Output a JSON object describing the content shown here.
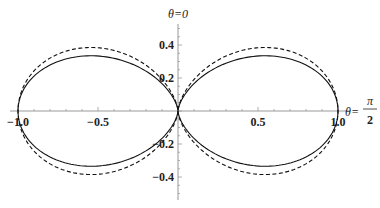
{
  "chart_data": {
    "type": "line",
    "title": "",
    "xlabel": "θ=π/2",
    "ylabel": "θ=0",
    "xlim": [
      -1.0,
      1.0
    ],
    "ylim": [
      -0.5,
      0.5
    ],
    "x_ticks": [
      {
        "value": -1.0,
        "label": "−1.0"
      },
      {
        "value": -0.5,
        "label": "−0.5"
      },
      {
        "value": 0.5,
        "label": "0.5"
      },
      {
        "value": 1.0,
        "label": "1.0"
      }
    ],
    "y_ticks": [
      {
        "value": 0.4,
        "label": "0.4"
      },
      {
        "value": 0.2,
        "label": "0.2"
      },
      {
        "value": -0.2,
        "label": "−0.2"
      },
      {
        "value": -0.4,
        "label": "−0.4"
      }
    ],
    "grid": false,
    "legend": null,
    "series": [
      {
        "name": "solid",
        "style": "solid",
        "color": "#111111",
        "peak_y": 0.333,
        "peak_x": 0.54,
        "x_extent": 1.0,
        "y_scale": 0.87
      },
      {
        "name": "dashed",
        "style": "dashed",
        "color": "#111111",
        "peak_y": 0.376,
        "peak_x": 0.54,
        "x_extent": 1.0,
        "y_scale": 1.0
      }
    ]
  },
  "labels": {
    "y_axis_title": "θ=0",
    "x_axis_title_prefix": "θ=",
    "x_axis_title_num": "π",
    "x_axis_title_den": "2"
  }
}
